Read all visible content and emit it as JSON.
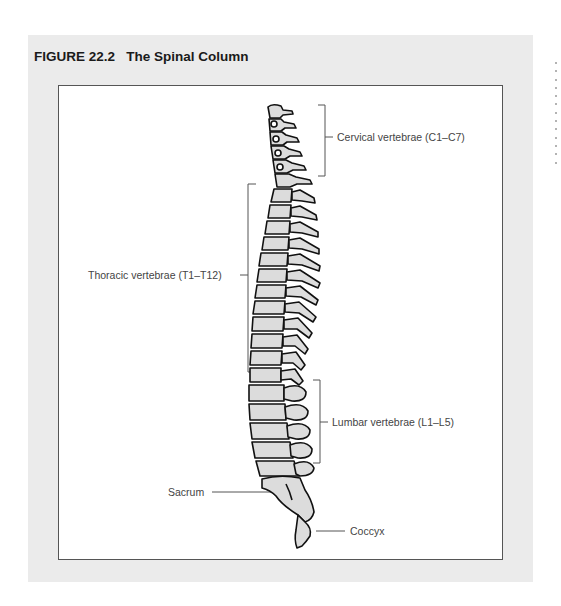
{
  "figure": {
    "title": "FIGURE 22.2   The Spinal Column",
    "background_color": "#ebebeb",
    "frame_border_color": "#555555"
  },
  "labels": {
    "cervical": "Cervical vertebrae (C1–C7)",
    "thoracic": "Thoracic vertebrae (T1–T12)",
    "lumbar": "Lumbar vertebrae (L1–L5)",
    "sacrum": "Sacrum",
    "coccyx": "Coccyx"
  },
  "margin_dots": {
    "count": 13
  }
}
